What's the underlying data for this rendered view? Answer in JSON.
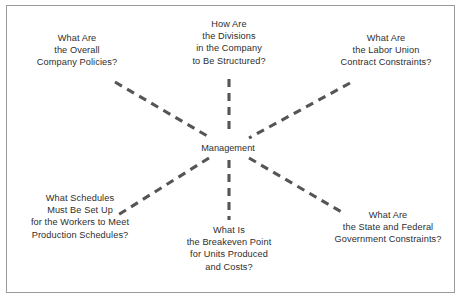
{
  "diagram": {
    "type": "spoke",
    "background_color": "#ffffff",
    "border_color": "#9a9a9a",
    "text_color": "#2e2e2e",
    "connector_color": "#555555",
    "connector_style": "dashed",
    "hub": {
      "label": "Management"
    },
    "nodes": [
      {
        "id": "company-policies",
        "position": "top-left",
        "lines": [
          "What Are",
          "the Overall",
          "Company Policies?"
        ]
      },
      {
        "id": "division-structure",
        "position": "top-center",
        "lines": [
          "How Are",
          "the Divisions",
          "in the Company",
          "to Be Structured?"
        ]
      },
      {
        "id": "labor-union-contract",
        "position": "top-right",
        "lines": [
          "What Are",
          "the Labor Union",
          "Contract Constraints?"
        ]
      },
      {
        "id": "worker-schedules",
        "position": "bottom-left",
        "lines": [
          "What Schedules",
          "Must Be Set Up",
          "for the Workers to Meet",
          "Production Schedules?"
        ]
      },
      {
        "id": "breakeven-point",
        "position": "bottom-center",
        "lines": [
          "What Is",
          "the Breakeven Point",
          "for Units Produced",
          "and Costs?"
        ]
      },
      {
        "id": "government-constraints",
        "position": "bottom-right",
        "lines": [
          "What Are",
          "the State and Federal",
          "Government Constraints?"
        ]
      }
    ]
  }
}
